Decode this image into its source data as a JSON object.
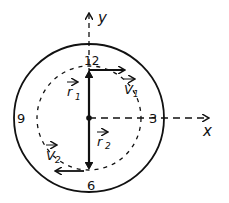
{
  "diagram": {
    "type": "clock-hand vector diagram",
    "axes": {
      "x_label": "x",
      "y_label": "y"
    },
    "clock_numbers": {
      "top": "12",
      "right": "3",
      "bottom": "6",
      "left": "9"
    },
    "vectors": {
      "r1": {
        "label": "r",
        "subscript": "1",
        "direction": "center to 12"
      },
      "r2": {
        "label": "r",
        "subscript": "2",
        "direction": "center to 6"
      },
      "v1": {
        "label": "V",
        "subscript": "1",
        "direction": "rightward at 12"
      },
      "v2": {
        "label": "V",
        "subscript": "2",
        "direction": "leftward at 6"
      }
    },
    "colors": {
      "ink": "#111111",
      "background": "#ffffff"
    }
  }
}
